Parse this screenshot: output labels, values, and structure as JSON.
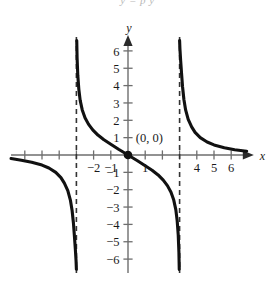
{
  "header": {
    "cropped_text": "y = p          y"
  },
  "figure": {
    "title": "",
    "origin_label": "(0, 0)",
    "x_axis_label": "x",
    "y_axis_label": "y"
  },
  "chart_data": {
    "type": "line",
    "title": "",
    "xlabel": "x",
    "ylabel": "y",
    "xlim": [
      -6.8,
      7.2
    ],
    "ylim": [
      -6.8,
      6.8
    ],
    "grid": false,
    "legend": null,
    "x_ticks": [
      -6,
      -5,
      -4,
      -3,
      -2,
      -1,
      1,
      2,
      3,
      4,
      5,
      6
    ],
    "x_tick_labels": [
      "",
      "",
      "",
      "",
      "-2",
      "-1",
      "1",
      "",
      "",
      "4",
      "5",
      "6"
    ],
    "y_ticks": [
      -6,
      -5,
      -4,
      -3,
      -2,
      -1,
      1,
      2,
      3,
      4,
      5,
      6
    ],
    "y_tick_labels": [
      "-6",
      "-5",
      "-4",
      "-3",
      "-2",
      "-1",
      "1",
      "2",
      "3",
      "4",
      "5",
      "6"
    ],
    "asymptotes": [
      {
        "type": "vertical",
        "x": -3,
        "style": "dashed"
      },
      {
        "type": "vertical",
        "x": 3,
        "style": "dashed"
      }
    ],
    "annotations": [
      {
        "text": "(0, 0)",
        "x": 0.45,
        "y": 1.0,
        "marker": "filled-dot",
        "marker_x": 0,
        "marker_y": 0
      }
    ],
    "series": [
      {
        "name": "left-branch",
        "style": "solid",
        "color": "#111111",
        "points": [
          [
            -6.8,
            -0.2
          ],
          [
            -6.2,
            -0.3
          ],
          [
            -5.6,
            -0.42
          ],
          [
            -5.0,
            -0.58
          ],
          [
            -4.6,
            -0.75
          ],
          [
            -4.2,
            -1.0
          ],
          [
            -3.9,
            -1.3
          ],
          [
            -3.7,
            -1.62
          ],
          [
            -3.5,
            -2.05
          ],
          [
            -3.35,
            -2.6
          ],
          [
            -3.25,
            -3.2
          ],
          [
            -3.17,
            -3.95
          ],
          [
            -3.11,
            -4.75
          ],
          [
            -3.06,
            -5.45
          ],
          [
            -3.02,
            -6.1
          ],
          [
            -3.0,
            -6.6
          ]
        ]
      },
      {
        "name": "middle-branch",
        "style": "solid",
        "color": "#111111",
        "points": [
          [
            -3.0,
            6.6
          ],
          [
            -3.02,
            6.1
          ],
          [
            -3.06,
            5.45
          ],
          [
            -3.11,
            4.75
          ],
          [
            -3.17,
            3.95
          ],
          [
            -3.25,
            3.2
          ],
          [
            -3.35,
            2.6
          ],
          [
            -3.5,
            2.05
          ],
          [
            -3.7,
            1.62
          ],
          [
            -3.9,
            1.3
          ],
          [
            -4.2,
            1.0
          ],
          [
            -4.6,
            0.75
          ],
          [
            -5.0,
            0.58
          ],
          [
            -5.6,
            0.42
          ],
          [
            -6.2,
            0.3
          ]
        ],
        "note": "placeholder-replaced-in-render"
      },
      {
        "name": "right-branch",
        "style": "solid",
        "color": "#111111",
        "points": [
          [
            3.0,
            6.6
          ],
          [
            3.02,
            6.1
          ],
          [
            3.06,
            5.45
          ],
          [
            3.11,
            4.75
          ],
          [
            3.17,
            3.95
          ],
          [
            3.25,
            3.2
          ],
          [
            3.35,
            2.6
          ],
          [
            3.5,
            2.05
          ],
          [
            3.7,
            1.62
          ],
          [
            3.9,
            1.3
          ],
          [
            4.2,
            1.0
          ],
          [
            4.6,
            0.75
          ],
          [
            5.0,
            0.58
          ],
          [
            5.6,
            0.42
          ],
          [
            6.2,
            0.3
          ],
          [
            6.9,
            0.22
          ]
        ]
      },
      {
        "name": "center-branch",
        "style": "solid",
        "color": "#111111",
        "points": [
          [
            -2.98,
            6.6
          ],
          [
            -2.96,
            5.6
          ],
          [
            -2.92,
            4.6
          ],
          [
            -2.86,
            3.8
          ],
          [
            -2.78,
            3.15
          ],
          [
            -2.66,
            2.6
          ],
          [
            -2.5,
            2.15
          ],
          [
            -2.3,
            1.78
          ],
          [
            -2.05,
            1.45
          ],
          [
            -1.75,
            1.15
          ],
          [
            -1.4,
            0.88
          ],
          [
            -1.0,
            0.62
          ],
          [
            -0.55,
            0.33
          ],
          [
            0,
            0
          ],
          [
            0.55,
            -0.33
          ],
          [
            1.0,
            -0.62
          ],
          [
            1.4,
            -0.88
          ],
          [
            1.75,
            -1.15
          ],
          [
            2.05,
            -1.45
          ],
          [
            2.3,
            -1.78
          ],
          [
            2.5,
            -2.15
          ],
          [
            2.66,
            -2.6
          ],
          [
            2.78,
            -3.15
          ],
          [
            2.86,
            -3.8
          ],
          [
            2.92,
            -4.6
          ],
          [
            2.96,
            -5.6
          ],
          [
            2.98,
            -6.6
          ]
        ]
      }
    ]
  }
}
